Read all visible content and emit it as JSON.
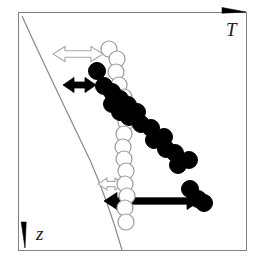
{
  "figure": {
    "name": "schematic-diagram-polymer-chains-temperature-depth",
    "background_color": "#ffffff",
    "width": 257,
    "height": 263,
    "frame": {
      "name": "plot-frame",
      "stroke_color": "#808080",
      "stroke_width": 1,
      "x": 18,
      "y": 12,
      "width": 228,
      "height": 238
    },
    "axes": {
      "horizontal": {
        "label": "T",
        "label_name": "axis-label-temperature",
        "direction": "right",
        "arrow_color": "#000000",
        "label_x": 226,
        "label_y": 20,
        "arrow_x1": 222,
        "arrow_y1": 12,
        "arrow_x2": 246,
        "arrow_y2": 12
      },
      "vertical": {
        "label": "z",
        "label_name": "axis-label-depth",
        "direction": "down",
        "arrow_color": "#000000",
        "label_x": 36,
        "label_y": 224,
        "arrow_x1": 25,
        "arrow_y1": 222,
        "arrow_x2": 25,
        "arrow_y2": 248
      }
    },
    "curve": {
      "name": "boundary-curve",
      "stroke_color": "#888888",
      "stroke_width": 1.2,
      "path": "M 22,16 C 40,56 66,110 90,160 C 104,192 114,222 122,250"
    },
    "chains": [
      {
        "name": "open-circle-chain",
        "fill": "#ffffff",
        "stroke": "#999999",
        "stroke_width": 1.2,
        "radius": 8,
        "circles": [
          {
            "cx": 109,
            "cy": 49
          },
          {
            "cx": 117,
            "cy": 59
          },
          {
            "cx": 116,
            "cy": 72
          },
          {
            "cx": 119,
            "cy": 85
          },
          {
            "cx": 124,
            "cy": 97
          },
          {
            "cx": 124,
            "cy": 110
          },
          {
            "cx": 126,
            "cy": 122
          },
          {
            "cx": 124,
            "cy": 134
          },
          {
            "cx": 123,
            "cy": 147
          },
          {
            "cx": 124,
            "cy": 159
          },
          {
            "cx": 126,
            "cy": 171
          },
          {
            "cx": 125,
            "cy": 184
          },
          {
            "cx": 127,
            "cy": 196
          },
          {
            "cx": 125,
            "cy": 208
          },
          {
            "cx": 126,
            "cy": 222
          }
        ]
      },
      {
        "name": "filled-circle-chain",
        "fill": "#000000",
        "stroke": "#000000",
        "stroke_width": 1,
        "radius": 8.5,
        "circles": [
          {
            "cx": 97,
            "cy": 71
          },
          {
            "cx": 104,
            "cy": 86
          },
          {
            "cx": 112,
            "cy": 92
          },
          {
            "cx": 112,
            "cy": 104
          },
          {
            "cx": 120,
            "cy": 99
          },
          {
            "cx": 120,
            "cy": 112
          },
          {
            "cx": 128,
            "cy": 105
          },
          {
            "cx": 129,
            "cy": 117
          },
          {
            "cx": 137,
            "cy": 112
          },
          {
            "cx": 141,
            "cy": 124
          },
          {
            "cx": 151,
            "cy": 128
          },
          {
            "cx": 154,
            "cy": 140
          },
          {
            "cx": 164,
            "cy": 137
          },
          {
            "cx": 166,
            "cy": 149
          },
          {
            "cx": 175,
            "cy": 153
          },
          {
            "cx": 178,
            "cy": 165
          },
          {
            "cx": 189,
            "cy": 160
          },
          {
            "cx": 190,
            "cy": 189
          },
          {
            "cx": 198,
            "cy": 199
          },
          {
            "cx": 204,
            "cy": 203
          }
        ]
      }
    ],
    "arrows": [
      {
        "name": "upper-open-double-arrow",
        "style": "outline",
        "fill": "#ffffff",
        "stroke": "#aaaaaa",
        "x1": 53,
        "y1": 54,
        "x2": 103,
        "y2": 54,
        "shaft_half_height": 3.2,
        "head_half_height": 7.5,
        "head_length": 12
      },
      {
        "name": "upper-filled-double-arrow",
        "style": "solid",
        "fill": "#000000",
        "stroke": "#000000",
        "x1": 63,
        "y1": 85,
        "x2": 96,
        "y2": 85,
        "shaft_half_height": 3.0,
        "head_half_height": 7.5,
        "head_length": 11
      },
      {
        "name": "lower-open-double-arrow",
        "style": "outline",
        "fill": "#ffffff",
        "stroke": "#aaaaaa",
        "x1": 98,
        "y1": 184,
        "x2": 124,
        "y2": 184,
        "shaft_half_height": 2.6,
        "head_half_height": 6.0,
        "head_length": 9
      },
      {
        "name": "lower-filled-double-arrow",
        "style": "solid",
        "fill": "#000000",
        "stroke": "#000000",
        "x1": 104,
        "y1": 201,
        "x2": 200,
        "y2": 201,
        "shaft_half_height": 3.2,
        "head_half_height": 8.5,
        "head_length": 13
      }
    ]
  }
}
